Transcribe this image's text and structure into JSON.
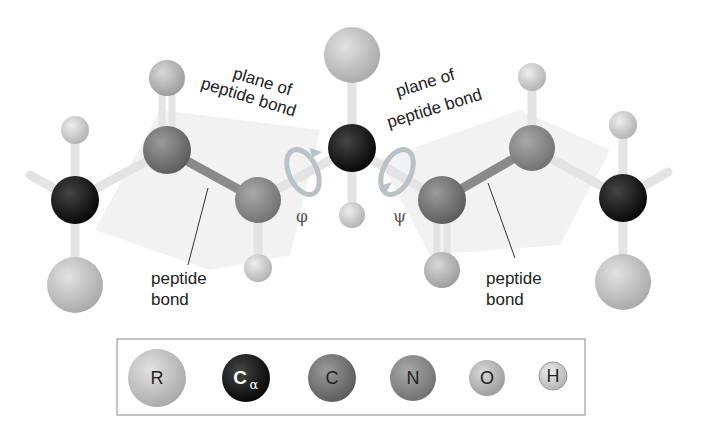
{
  "labels": {
    "plane_left_line1": "plane of",
    "plane_left_line2": "peptide bond",
    "plane_right_line1": "plane of",
    "plane_right_line2": "peptide bond",
    "peptide_left_line1": "peptide",
    "peptide_left_line2": "bond",
    "peptide_right_line1": "peptide",
    "peptide_right_line2": "bond",
    "phi": "φ",
    "psi": "ψ"
  },
  "legend": {
    "items": [
      {
        "key": "R",
        "label": "R",
        "color": "#c4c4c4"
      },
      {
        "key": "Calpha",
        "label": "C",
        "sub": "α",
        "color": "#111111"
      },
      {
        "key": "C",
        "label": "C",
        "color": "#7a7a7a"
      },
      {
        "key": "N",
        "label": "N",
        "color": "#8e8e8e"
      },
      {
        "key": "O",
        "label": "O",
        "color": "#b4b4b4"
      },
      {
        "key": "H",
        "label": "H",
        "color": "#cfcfcf"
      }
    ]
  },
  "colors": {
    "bond": "#e2e2e2",
    "peptide_bond": "#8a8a8a",
    "rotation_arrow": "#b9c2c6",
    "plane_shade": "#f1f1f1"
  }
}
